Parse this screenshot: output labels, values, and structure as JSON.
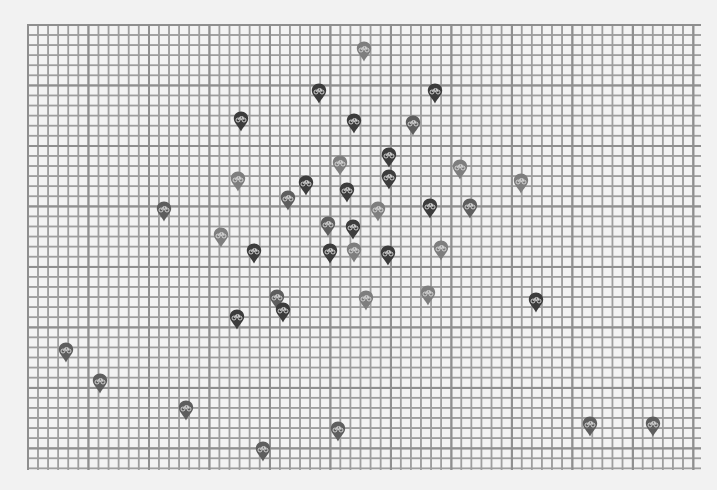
{
  "map": {
    "grid": {
      "cell_size_px": 10,
      "major_every_cells": 6,
      "line_color": "#8a8a8a",
      "background": "#f4f4f4"
    },
    "marker_icon": "bicycle-pin-icon",
    "shade_colors": {
      "dark": "#3c3c3c",
      "medium": "#5e5e5e",
      "light": "#7e7e7e"
    },
    "markers": [
      {
        "x": 364,
        "y": 50,
        "shade": "light"
      },
      {
        "x": 319,
        "y": 92,
        "shade": "dark"
      },
      {
        "x": 435,
        "y": 92,
        "shade": "dark"
      },
      {
        "x": 241,
        "y": 120,
        "shade": "dark"
      },
      {
        "x": 354,
        "y": 122,
        "shade": "dark"
      },
      {
        "x": 413,
        "y": 124,
        "shade": "medium"
      },
      {
        "x": 389,
        "y": 156,
        "shade": "dark"
      },
      {
        "x": 340,
        "y": 164,
        "shade": "light"
      },
      {
        "x": 460,
        "y": 168,
        "shade": "light"
      },
      {
        "x": 238,
        "y": 180,
        "shade": "light"
      },
      {
        "x": 306,
        "y": 184,
        "shade": "dark"
      },
      {
        "x": 389,
        "y": 178,
        "shade": "dark"
      },
      {
        "x": 521,
        "y": 182,
        "shade": "light"
      },
      {
        "x": 347,
        "y": 191,
        "shade": "dark"
      },
      {
        "x": 288,
        "y": 199,
        "shade": "medium"
      },
      {
        "x": 164,
        "y": 210,
        "shade": "medium"
      },
      {
        "x": 378,
        "y": 210,
        "shade": "light"
      },
      {
        "x": 430,
        "y": 207,
        "shade": "dark"
      },
      {
        "x": 470,
        "y": 207,
        "shade": "medium"
      },
      {
        "x": 328,
        "y": 225,
        "shade": "medium"
      },
      {
        "x": 353,
        "y": 228,
        "shade": "dark"
      },
      {
        "x": 221,
        "y": 236,
        "shade": "light"
      },
      {
        "x": 254,
        "y": 252,
        "shade": "dark"
      },
      {
        "x": 330,
        "y": 252,
        "shade": "dark"
      },
      {
        "x": 354,
        "y": 251,
        "shade": "light"
      },
      {
        "x": 388,
        "y": 254,
        "shade": "dark"
      },
      {
        "x": 441,
        "y": 249,
        "shade": "light"
      },
      {
        "x": 428,
        "y": 294,
        "shade": "light"
      },
      {
        "x": 366,
        "y": 299,
        "shade": "light"
      },
      {
        "x": 536,
        "y": 301,
        "shade": "dark"
      },
      {
        "x": 277,
        "y": 298,
        "shade": "medium"
      },
      {
        "x": 283,
        "y": 311,
        "shade": "dark"
      },
      {
        "x": 237,
        "y": 318,
        "shade": "dark"
      },
      {
        "x": 66,
        "y": 351,
        "shade": "medium"
      },
      {
        "x": 100,
        "y": 382,
        "shade": "medium"
      },
      {
        "x": 186,
        "y": 409,
        "shade": "medium"
      },
      {
        "x": 338,
        "y": 430,
        "shade": "medium"
      },
      {
        "x": 590,
        "y": 425,
        "shade": "medium"
      },
      {
        "x": 653,
        "y": 425,
        "shade": "medium"
      },
      {
        "x": 263,
        "y": 450,
        "shade": "medium"
      }
    ]
  }
}
